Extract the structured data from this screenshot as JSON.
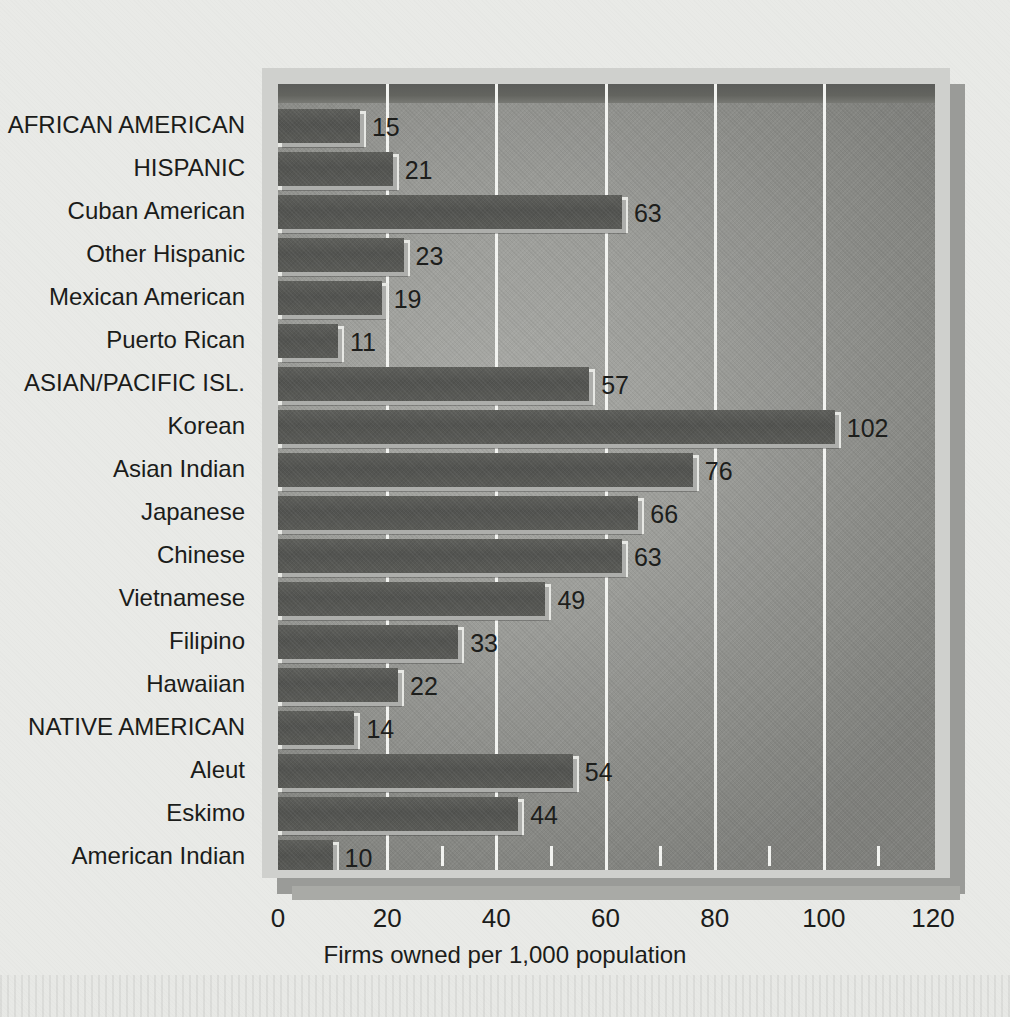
{
  "chart_data": {
    "type": "bar",
    "orientation": "horizontal",
    "title": "",
    "xlabel": "Firms owned per 1,000 population",
    "ylabel": "",
    "xlim": [
      0,
      120
    ],
    "xticks": [
      0,
      20,
      40,
      60,
      80,
      100,
      120
    ],
    "xtick_labels": [
      "0",
      "20",
      "40",
      "60",
      "80",
      "100",
      "120"
    ],
    "minor_tick_step": 10,
    "grid": "vertical-major",
    "legend": "none",
    "categories": [
      "AFRICAN AMERICAN",
      "HISPANIC",
      "Cuban American",
      "Other Hispanic",
      "Mexican American",
      "Puerto Rican",
      "ASIAN/PACIFIC ISL.",
      "Korean",
      "Asian Indian",
      "Japanese",
      "Chinese",
      "Vietnamese",
      "Filipino",
      "Hawaiian",
      "NATIVE AMERICAN",
      "Aleut",
      "Eskimo",
      "American Indian"
    ],
    "values": [
      15,
      21,
      63,
      23,
      19,
      11,
      57,
      102,
      76,
      66,
      63,
      49,
      33,
      22,
      14,
      54,
      44,
      10
    ],
    "value_labels": [
      "15",
      "21",
      "63",
      "23",
      "19",
      "11",
      "57",
      "102",
      "76",
      "66",
      "63",
      "49",
      "33",
      "22",
      "14",
      "54",
      "44",
      "10"
    ]
  },
  "colors": {
    "page_background": "#e9eae7",
    "frame": "#cfd0cd",
    "plot_background": "#9d9e9a",
    "bar_fill": "#545551",
    "bar_highlight": "#e7e8e4",
    "gridline": "#f2f3f0",
    "text": "#1b1c1a"
  }
}
